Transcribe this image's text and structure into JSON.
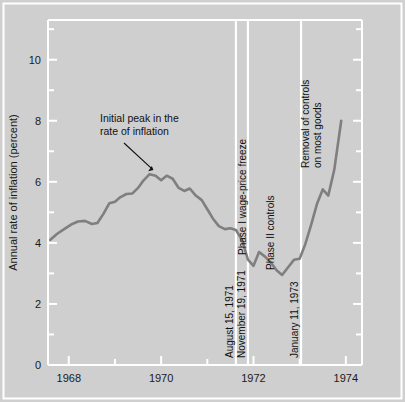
{
  "figure": {
    "background_color": "#cfcfcf",
    "plot_background_color": "#cfcfcf",
    "frame_color": "#ffffff",
    "line_color": "#7f7f7f",
    "text_color": "#111111"
  },
  "chart_data": {
    "type": "line",
    "title": "",
    "subtitle": "",
    "xlabel": "",
    "ylabel": "Annual rate of inflation (percent)",
    "xlim": [
      1967.55,
      1974.35
    ],
    "ylim": [
      0,
      11.3
    ],
    "grid": false,
    "legend": null,
    "xticks": [
      1968,
      1970,
      1972,
      1974
    ],
    "xtick_labels": [
      "1968",
      "1970",
      "1972",
      "1974"
    ],
    "x_minor_ticks": [
      1969,
      1971,
      1973
    ],
    "yticks": [
      0,
      2,
      4,
      6,
      8,
      10
    ],
    "ytick_labels": [
      "0",
      "2",
      "4",
      "6",
      "8",
      "10"
    ],
    "y_minor_ticks": [
      1,
      3,
      5,
      7,
      9,
      11
    ],
    "series": [
      {
        "name": "Annual rate of inflation",
        "color": "#7f7f7f",
        "x": [
          1967.6,
          1967.75,
          1967.9,
          1968.05,
          1968.2,
          1968.35,
          1968.5,
          1968.62,
          1968.75,
          1968.88,
          1969.0,
          1969.12,
          1969.25,
          1969.38,
          1969.5,
          1969.62,
          1969.75,
          1969.88,
          1970.0,
          1970.12,
          1970.25,
          1970.38,
          1970.5,
          1970.62,
          1970.75,
          1970.88,
          1971.0,
          1971.12,
          1971.25,
          1971.38,
          1971.5,
          1971.62,
          1971.75,
          1971.88,
          1972.0,
          1972.12,
          1972.25,
          1972.38,
          1972.5,
          1972.62,
          1972.75,
          1972.88,
          1973.0,
          1973.12,
          1973.25,
          1973.38,
          1973.5,
          1973.62,
          1973.75,
          1973.9
        ],
        "y": [
          4.1,
          4.3,
          4.45,
          4.6,
          4.7,
          4.72,
          4.62,
          4.65,
          4.95,
          5.3,
          5.35,
          5.5,
          5.6,
          5.62,
          5.8,
          6.05,
          6.25,
          6.2,
          6.05,
          6.2,
          6.1,
          5.8,
          5.7,
          5.78,
          5.55,
          5.4,
          5.1,
          4.8,
          4.55,
          4.45,
          4.48,
          4.42,
          4.1,
          3.45,
          3.25,
          3.7,
          3.55,
          3.35,
          3.1,
          2.95,
          3.2,
          3.45,
          3.48,
          3.95,
          4.6,
          5.3,
          5.75,
          5.55,
          6.4,
          8.0
        ]
      }
    ],
    "events": [
      {
        "id": "aug-1971",
        "x": 1971.62,
        "label": "August 15, 1971",
        "orientation": "vertical"
      },
      {
        "id": "nov-1971",
        "x": 1971.88,
        "label": "November 19, 1971",
        "orientation": "vertical"
      },
      {
        "id": "jan-1973",
        "x": 1973.03,
        "label": "January 11, 1973",
        "orientation": "vertical"
      }
    ],
    "period_labels": [
      {
        "id": "phase-1",
        "text": "Phase I wage-price freeze",
        "x": 1971.75
      },
      {
        "id": "phase-2",
        "text": "Phase II controls",
        "x": 1972.35
      }
    ],
    "annotations": [
      {
        "id": "initial-peak",
        "lines": [
          "Initial peak in the",
          "rate of inflation"
        ],
        "orientation": "horizontal",
        "arrow_to_x": 1969.72,
        "arrow_to_y": 6.35
      },
      {
        "id": "removal-of-controls",
        "lines": [
          "Removal of controls",
          "on most goods"
        ],
        "orientation": "vertical",
        "x": 1973.2
      }
    ]
  }
}
